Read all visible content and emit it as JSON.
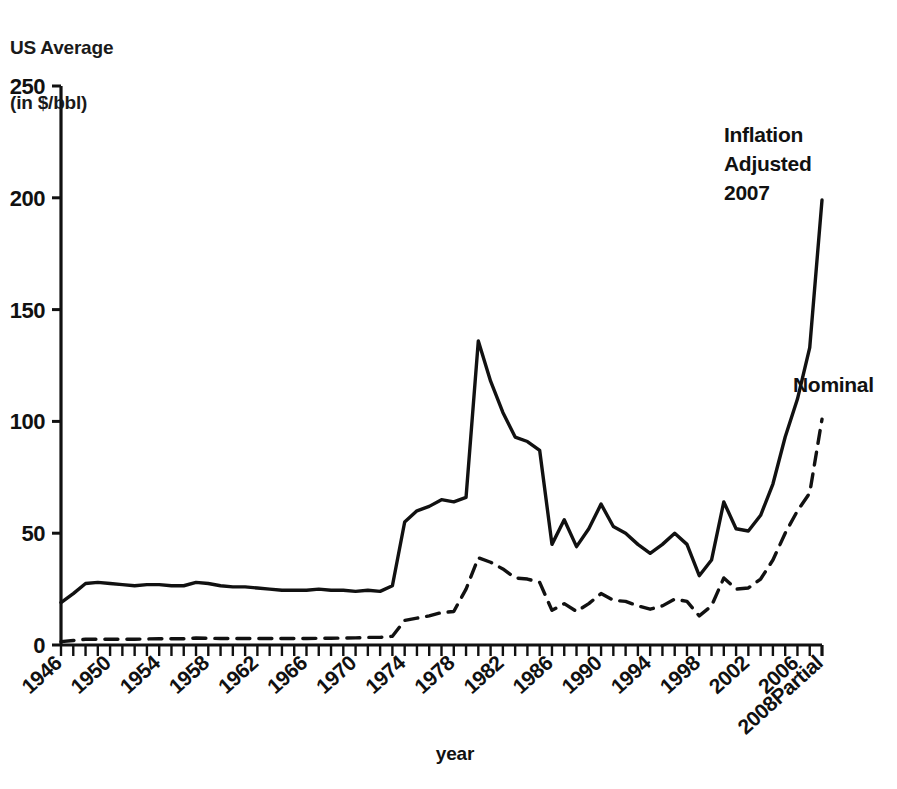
{
  "chart_data": {
    "type": "line",
    "title": "",
    "ylabel_lines": [
      "US Average",
      "(in $/bbl)"
    ],
    "xlabel": "year",
    "ylim": [
      0,
      250
    ],
    "yticks": [
      0,
      50,
      100,
      150,
      200,
      250
    ],
    "ytick_labels": [
      "0",
      "50",
      "100",
      "150",
      "200",
      "250"
    ],
    "xlim": [
      1946,
      2008
    ],
    "xticks_every": 1,
    "xtick_label_every": 4,
    "xtick_labels": [
      "1946",
      "1950",
      "1954",
      "1958",
      "1962",
      "1966",
      "1970",
      "1974",
      "1978",
      "1982",
      "1986",
      "1990",
      "1994",
      "1998",
      "2002",
      "2006",
      "2008Partial"
    ],
    "xtick_label_years": [
      1946,
      1950,
      1954,
      1958,
      1962,
      1966,
      1970,
      1974,
      1978,
      1982,
      1986,
      1990,
      1994,
      1998,
      2002,
      2006,
      2008
    ],
    "grid": false,
    "legend_position": "inline-annotation",
    "annotations": [
      {
        "name": "inflation-adjusted-label",
        "text_lines": [
          "Inflation",
          "Adjusted",
          "2007"
        ],
        "x": 724,
        "y": 142
      },
      {
        "name": "nominal-label",
        "text_lines": [
          "Nominal"
        ],
        "x": 793,
        "y": 392
      }
    ],
    "x": [
      1946,
      1947,
      1948,
      1949,
      1950,
      1951,
      1952,
      1953,
      1954,
      1955,
      1956,
      1957,
      1958,
      1959,
      1960,
      1961,
      1962,
      1963,
      1964,
      1965,
      1966,
      1967,
      1968,
      1969,
      1970,
      1971,
      1972,
      1973,
      1974,
      1975,
      1976,
      1977,
      1978,
      1979,
      1980,
      1981,
      1982,
      1983,
      1984,
      1985,
      1986,
      1987,
      1988,
      1989,
      1990,
      1991,
      1992,
      1993,
      1994,
      1995,
      1996,
      1997,
      1998,
      1999,
      2000,
      2001,
      2002,
      2003,
      2004,
      2005,
      2006,
      2007,
      2008
    ],
    "series": [
      {
        "name": "Inflation Adjusted 2007",
        "style": "solid",
        "color": "#111111",
        "values": [
          19,
          23,
          27.5,
          28,
          27.5,
          27,
          26.5,
          27,
          27,
          26.5,
          26.5,
          28,
          27.5,
          26.5,
          26,
          26,
          25.5,
          25,
          24.5,
          24.5,
          24.5,
          25,
          24.5,
          24.5,
          24,
          24.5,
          24,
          26.5,
          55,
          60,
          62,
          65,
          64,
          66,
          136,
          118,
          104,
          93,
          91,
          87,
          45,
          56,
          44,
          52,
          63,
          53,
          50,
          45,
          41,
          45,
          50,
          45,
          31,
          38,
          64,
          52,
          51,
          58,
          72,
          93,
          110,
          133,
          199
        ]
      },
      {
        "name": "Nominal",
        "style": "dashed",
        "color": "#111111",
        "values": [
          1.5,
          2,
          2.6,
          2.6,
          2.6,
          2.6,
          2.6,
          2.7,
          2.8,
          2.8,
          2.8,
          3.1,
          3.0,
          2.9,
          2.9,
          2.9,
          2.9,
          2.9,
          2.9,
          2.9,
          2.9,
          3.0,
          3.0,
          3.1,
          3.2,
          3.4,
          3.4,
          3.9,
          11,
          12,
          13,
          14.5,
          15,
          25,
          39,
          37,
          34,
          30,
          29.5,
          28,
          15.5,
          18.5,
          15,
          18.5,
          23,
          20,
          19.5,
          17.5,
          16,
          17.5,
          20.5,
          19.5,
          13,
          17.5,
          30,
          25,
          25.5,
          29.5,
          38,
          50,
          60,
          68,
          101
        ]
      }
    ]
  },
  "axes": {
    "plot_left": 61,
    "plot_right": 822,
    "plot_top": 86,
    "plot_bottom": 645
  }
}
